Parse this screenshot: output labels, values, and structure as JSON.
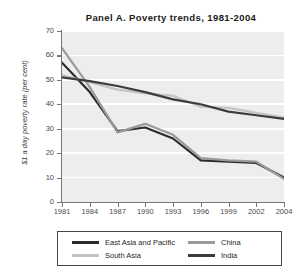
{
  "chart_data": {
    "type": "line",
    "title": "Panel A. Poverty trends, 1981-2004",
    "xlabel": "",
    "ylabel": "$1 a day poverty rate (per cent)",
    "x": [
      1981,
      1984,
      1987,
      1990,
      1993,
      1996,
      1999,
      2002,
      2004
    ],
    "xtick_labels": [
      "1981",
      "1984",
      "1987",
      "1990",
      "1993",
      "1996",
      "1999",
      "2002",
      "2004"
    ],
    "ytick_labels": [
      "0",
      "10",
      "20",
      "30",
      "40",
      "50",
      "60",
      "70"
    ],
    "yticks": [
      0,
      10,
      20,
      30,
      40,
      50,
      60,
      70
    ],
    "ylim": [
      0,
      70
    ],
    "grid": "horizontal",
    "legend_position": "bottom",
    "series": [
      {
        "name": "East Asia and Pacific",
        "color": "#2b2b2b",
        "values": [
          57.0,
          45.0,
          29.0,
          30.5,
          26.0,
          17.0,
          16.5,
          16.0,
          10.0
        ]
      },
      {
        "name": "China",
        "color": "#9a9a9a",
        "values": [
          63.0,
          47.0,
          28.5,
          32.0,
          27.5,
          18.0,
          17.0,
          16.5,
          9.5
        ]
      },
      {
        "name": "South Asia",
        "color": "#c4c4c4",
        "values": [
          52.0,
          49.0,
          46.0,
          44.5,
          43.5,
          39.0,
          38.5,
          36.5,
          34.5
        ]
      },
      {
        "name": "India",
        "color": "#3c3c3c",
        "values": [
          51.0,
          49.5,
          47.5,
          45.0,
          42.0,
          40.0,
          37.0,
          35.5,
          34.0
        ]
      }
    ]
  },
  "axes": {
    "y_label_text": "$1 a day poverty rate (per cent)"
  }
}
